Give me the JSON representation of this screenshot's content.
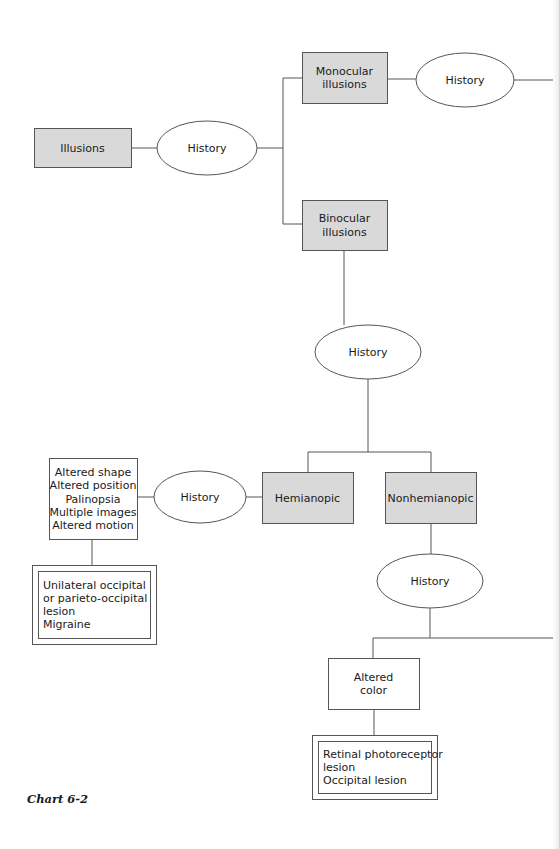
{
  "caption": "Chart 6-2",
  "colors": {
    "shaded_fill": "#d9d9d9",
    "line": "#555555",
    "text": "#1a1a1a"
  },
  "nodes": {
    "illusions": {
      "label": [
        "Illusions"
      ],
      "shape": "shaded-box"
    },
    "history_1": {
      "label": [
        "History"
      ],
      "shape": "ellipse"
    },
    "monocular": {
      "label": [
        "Monocular",
        "illusions"
      ],
      "shape": "shaded-box"
    },
    "history_mono": {
      "label": [
        "History"
      ],
      "shape": "ellipse"
    },
    "binocular": {
      "label": [
        "Binocular",
        "illusions"
      ],
      "shape": "shaded-box"
    },
    "history_bino": {
      "label": [
        "History"
      ],
      "shape": "ellipse"
    },
    "hemianopic": {
      "label": [
        "Hemianopic"
      ],
      "shape": "shaded-box"
    },
    "nonhemianopic": {
      "label": [
        "Nonhemianopic"
      ],
      "shape": "shaded-box"
    },
    "history_hemi": {
      "label": [
        "History"
      ],
      "shape": "ellipse"
    },
    "hemi_findings": {
      "label": [
        "Altered shape",
        "Altered position",
        "Palinopsia",
        "Multiple images",
        "Altered motion"
      ],
      "shape": "box"
    },
    "hemi_diagnosis": {
      "label": [
        "Unilateral occipital",
        "  or parieto-occipital",
        "  lesion",
        "Migraine"
      ],
      "shape": "double-box"
    },
    "history_nonhemi": {
      "label": [
        "History"
      ],
      "shape": "ellipse"
    },
    "altered_color": {
      "label": [
        "Altered",
        "color"
      ],
      "shape": "box"
    },
    "color_diagnosis": {
      "label": [
        "Retinal photoreceptor",
        "  lesion",
        "Occipital lesion"
      ],
      "shape": "double-box"
    }
  },
  "edges": [
    [
      "illusions",
      "history_1"
    ],
    [
      "history_1",
      "monocular"
    ],
    [
      "history_1",
      "binocular"
    ],
    [
      "monocular",
      "history_mono"
    ],
    [
      "binocular",
      "history_bino"
    ],
    [
      "history_bino",
      "hemianopic"
    ],
    [
      "history_bino",
      "nonhemianopic"
    ],
    [
      "hemianopic",
      "history_hemi"
    ],
    [
      "history_hemi",
      "hemi_findings"
    ],
    [
      "hemi_findings",
      "hemi_diagnosis"
    ],
    [
      "nonhemianopic",
      "history_nonhemi"
    ],
    [
      "history_nonhemi",
      "altered_color"
    ],
    [
      "altered_color",
      "color_diagnosis"
    ]
  ]
}
